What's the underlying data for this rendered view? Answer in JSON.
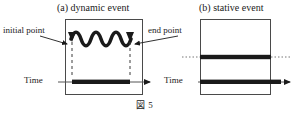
{
  "figure": {
    "caption": "図 5",
    "panels": [
      {
        "id": "a",
        "title": "(a) dynamic event",
        "event_type": "dynamic",
        "annotations": [
          {
            "name": "initial-point",
            "label": "initial point"
          },
          {
            "name": "end-point",
            "label": "end point"
          }
        ],
        "axis_label": "Time",
        "description": "oscillating wave bounded by initial and end points, with bounded interval bar on the time axis"
      },
      {
        "id": "b",
        "title": "(b) stative event",
        "event_type": "stative",
        "annotations": [],
        "axis_label": "Time",
        "description": "two unbounded horizontal bars extending past the panel with dotted continuations"
      }
    ]
  },
  "colors": {
    "ink": "#1a1a1a",
    "box_border": "#4a4a4a",
    "leader": "#555555",
    "dotted": "#777777",
    "background": "#ffffff"
  }
}
